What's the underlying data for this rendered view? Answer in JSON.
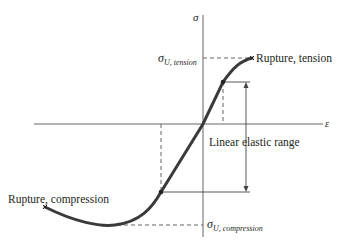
{
  "diagram": {
    "type": "stress-strain curve",
    "axes": {
      "x_label": "ε",
      "y_label": "σ"
    },
    "labels": {
      "sigma_symbol": "σ",
      "tension_sub": "U, tension",
      "compression_sub": "U, compression",
      "rupture_tension": "Rupture, tension",
      "rupture_compression": "Rupture, compression",
      "linear_elastic": "Linear elastic range"
    },
    "colors": {
      "curve": "#3a3a3a",
      "axes": "#555555",
      "text": "#231f20"
    }
  }
}
